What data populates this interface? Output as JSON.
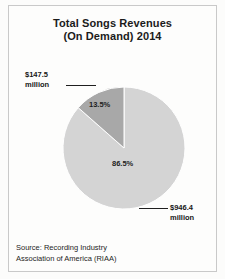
{
  "title": {
    "line1": "Total Songs Revenues",
    "line2": "(On Demand) 2014"
  },
  "callouts": {
    "left": {
      "amount": "$147.5",
      "unit": "million"
    },
    "right": {
      "amount": "$946.4",
      "unit": "million"
    }
  },
  "source": {
    "line1": "Source: Recording Industry",
    "line2": "Association of America (RIAA)"
  },
  "colors": {
    "slice_small": "#a8a8a8",
    "slice_large": "#d4d4d4",
    "slice_edge": "#ffffff",
    "text": "#1b1b1b",
    "frame": "#c9c9c9",
    "background": "#fdfdfc"
  },
  "chart_data": {
    "type": "pie",
    "title": "Total Songs Revenues (On Demand) 2014",
    "labels": [
      "On Demand streaming (subscription/ad-supported)",
      "Other song revenues"
    ],
    "values": [
      13.5,
      86.5
    ],
    "value_unit": "percent",
    "data_labels": [
      "13.5%",
      "86.5%"
    ],
    "amounts": [
      "$147.5 million",
      "$946.4 million"
    ],
    "amounts_numeric": [
      147.5,
      946.4
    ],
    "amounts_unit": "USD millions",
    "total_amount": "$1,093.9 million",
    "colors": [
      "#a8a8a8",
      "#d4d4d4"
    ],
    "start_angle_deg": 90,
    "direction": "counterclockwise",
    "legend": false,
    "grid": false,
    "source": "Source: Recording Industry Association of America (RIAA)"
  }
}
